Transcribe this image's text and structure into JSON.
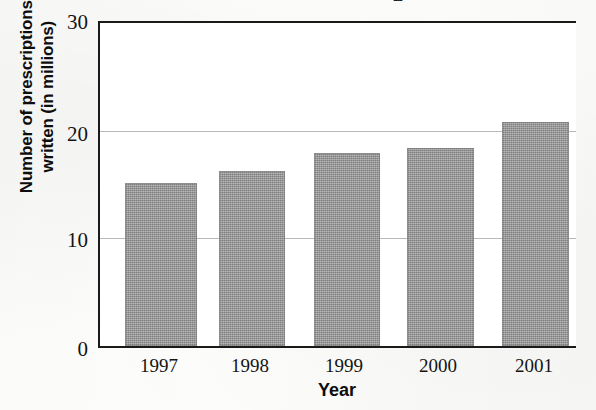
{
  "chart_data": {
    "type": "bar",
    "title": "",
    "xlabel": "Year",
    "ylabel": "Number of prescriptions written (in millions)",
    "ylabel_line1": "Number of prescriptions",
    "ylabel_line2": "written (in millions)",
    "categories": [
      "1997",
      "1998",
      "1999",
      "2000",
      "2001"
    ],
    "values": [
      15.1,
      16.3,
      17.9,
      18.4,
      20.8
    ],
    "ylim": [
      0,
      30
    ],
    "yticks": [
      0,
      10,
      20,
      30
    ],
    "ytick_labels": [
      "0",
      "10",
      "20",
      "30"
    ],
    "gridlines": [
      10,
      20
    ],
    "grid": true,
    "legend": "none",
    "bar_color": "#8e8e8e",
    "axis_color": "#1a1a1a",
    "grid_color": "#b9b9b9",
    "background": "#ffffff"
  },
  "figure": {
    "clipped_top_fragment": "g",
    "plot": {
      "left_px": 98,
      "top_px": 21,
      "width_px": 478,
      "height_px": 327
    }
  }
}
